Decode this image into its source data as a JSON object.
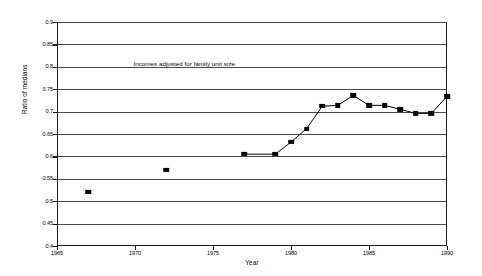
{
  "chart_data": {
    "type": "scatter",
    "title": "",
    "annotation": "Incomes adjusted for family unit size",
    "xlabel": "Year",
    "ylabel": "Ratio of medians",
    "xlim": [
      1965,
      1990
    ],
    "ylim": [
      0.4,
      0.9
    ],
    "grid": true,
    "legend": "none",
    "xticks": [
      1965,
      1970,
      1975,
      1980,
      1985,
      1990
    ],
    "xtick_labels": [
      "1965",
      "1970",
      "1975",
      "1980",
      "1985",
      "1990"
    ],
    "yticks": [
      0.4,
      0.45,
      0.5,
      0.55,
      0.6,
      0.65,
      0.7,
      0.75,
      0.8,
      0.85,
      0.9
    ],
    "ytick_labels": [
      "0.4",
      "0.45",
      "0.5",
      "0.55",
      "0.6",
      "0.65",
      "0.7",
      "0.75",
      "0.8",
      "0.85",
      "0.9"
    ],
    "series": [
      {
        "name": "isolated-observations",
        "connected": false,
        "marker": "filled-square",
        "points": [
          {
            "x": 1967,
            "y": 0.52
          },
          {
            "x": 1972,
            "y": 0.57
          }
        ]
      },
      {
        "name": "annual-series",
        "connected": true,
        "marker": "filled-square",
        "points": [
          {
            "x": 1977,
            "y": 0.605
          },
          {
            "x": 1979,
            "y": 0.605
          },
          {
            "x": 1980,
            "y": 0.632
          },
          {
            "x": 1981,
            "y": 0.662
          },
          {
            "x": 1982,
            "y": 0.712
          },
          {
            "x": 1983,
            "y": 0.714
          },
          {
            "x": 1984,
            "y": 0.736
          },
          {
            "x": 1985,
            "y": 0.714
          },
          {
            "x": 1986,
            "y": 0.714
          },
          {
            "x": 1987,
            "y": 0.705
          },
          {
            "x": 1988,
            "y": 0.696
          },
          {
            "x": 1989,
            "y": 0.696
          },
          {
            "x": 1990,
            "y": 0.734
          }
        ]
      }
    ]
  }
}
